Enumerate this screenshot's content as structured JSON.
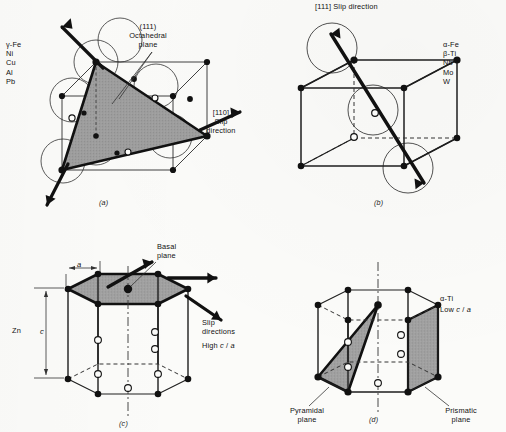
{
  "figure": {
    "background_color": "#fbfbf9",
    "ink_color": "#111111",
    "shade_color": "#9a9a9a"
  },
  "panels": [
    {
      "id": "(a)",
      "structure": "face-centered-cubic",
      "materials": "γ-Fe\nNi\nCu\nAl\nPb",
      "plane_label": "(111)\nOctahedral\nplane",
      "direction_label": "[110]\nSlip\ndirection"
    },
    {
      "id": "(b)",
      "structure": "body-centered-cubic",
      "materials": "α-Fe\nβ-Ti\nNb\nMo\nW",
      "direction_label": "[111] Slip direction"
    },
    {
      "id": "(c)",
      "structure": "hexagonal-close-packed-high-ca",
      "material": "Zn",
      "plane_label": "Basal\nplane",
      "direction_label": "Slip\ndirections",
      "ratio_label": "High c / a",
      "ratio_prefix": "High",
      "dim_a": "a",
      "dim_c": "c"
    },
    {
      "id": "(d)",
      "structure": "hexagonal-close-packed-low-ca",
      "material": "α-Ti",
      "ratio_label": "Low c / a",
      "ratio_prefix": "Low",
      "pyramidal_label": "Pyramidal\nplane",
      "prismatic_label": "Prismatic\nplane"
    }
  ]
}
